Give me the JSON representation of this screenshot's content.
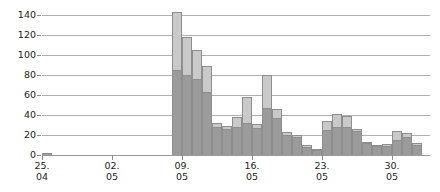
{
  "chart_data": {
    "type": "bar",
    "subtype": "stacked-bar",
    "title": "",
    "subtitle": "",
    "xlabel": "",
    "ylabel": "",
    "ylim": [
      0,
      148
    ],
    "yticks": [
      0,
      20,
      40,
      60,
      80,
      100,
      120,
      140
    ],
    "ytick_labels": [
      "0",
      "20",
      "40",
      "60",
      "80",
      "100",
      "120",
      "140"
    ],
    "grid": true,
    "grid_axis": "y",
    "legend": null,
    "legend_position": "none",
    "x_tick_labels": [
      {
        "day": "25.",
        "month": "04",
        "index": 0
      },
      {
        "day": "02.",
        "month": "05",
        "index": 7
      },
      {
        "day": "09.",
        "month": "05",
        "index": 14
      },
      {
        "day": "16.",
        "month": "05",
        "index": 21
      },
      {
        "day": "23.",
        "month": "05",
        "index": 28
      },
      {
        "day": "30.",
        "month": "05",
        "index": 35
      }
    ],
    "x": [
      "25.04",
      "26.04",
      "27.04",
      "28.04",
      "29.04",
      "30.04",
      "01.05",
      "02.05",
      "03.05",
      "04.05",
      "05.05",
      "06.05",
      "07.05",
      "08.05",
      "09.05",
      "10.05",
      "11.05",
      "12.05",
      "13.05",
      "14.05",
      "15.05",
      "16.05",
      "17.05",
      "18.05",
      "19.05",
      "20.05",
      "21.05",
      "22.05",
      "23.05",
      "24.05",
      "25.05",
      "26.05",
      "27.05",
      "28.05",
      "29.05",
      "30.05",
      "31.05",
      "01.06"
    ],
    "series": [
      {
        "name": "lower",
        "color": "#9b9b9b",
        "values": [
          2,
          0,
          0,
          0,
          0,
          0,
          0,
          0,
          0,
          0,
          0,
          0,
          0,
          85,
          80,
          76,
          63,
          28,
          26,
          28,
          32,
          27,
          47,
          37,
          20,
          18,
          8,
          5,
          25,
          28,
          28,
          24,
          12,
          9,
          9,
          15,
          18,
          10
        ]
      },
      {
        "name": "upper",
        "color": "#c9c9c9",
        "values": [
          0,
          0,
          0,
          0,
          0,
          0,
          0,
          0,
          0,
          0,
          0,
          0,
          0,
          58,
          38,
          29,
          26,
          4,
          3,
          10,
          26,
          4,
          33,
          9,
          3,
          2,
          2,
          1,
          9,
          13,
          11,
          2,
          1,
          1,
          2,
          9,
          4,
          2
        ]
      }
    ],
    "totals": [
      2,
      0,
      0,
      0,
      0,
      0,
      0,
      0,
      0,
      0,
      0,
      0,
      0,
      143,
      118,
      105,
      89,
      32,
      29,
      38,
      58,
      31,
      80,
      46,
      23,
      20,
      10,
      6,
      34,
      41,
      39,
      26,
      13,
      10,
      11,
      24,
      22,
      12
    ],
    "colors": {
      "lower_series": "#9b9b9b",
      "upper_series": "#c9c9c9",
      "gridline": "#b0b0b0",
      "axis": "#8a8a8a",
      "text": "#232323",
      "background": "#ffffff"
    },
    "geometry": {
      "plot_left_px": 42,
      "baseline_y_px": 155,
      "px_per_unit": 1.0,
      "px_per_day": 10,
      "bar_width_px": 10
    }
  }
}
